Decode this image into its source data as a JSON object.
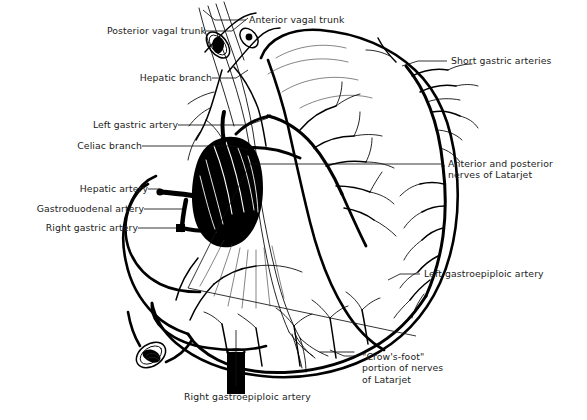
{
  "figure": {
    "type": "anatomical-line-illustration",
    "background_color": "#ffffff",
    "ink_color": "#000000",
    "label_color": "#222222"
  },
  "labels": [
    {
      "id": "posterior-vagal-trunk",
      "text": "Posterior vagal trunk",
      "align": "right",
      "x": 88,
      "y": 25
    },
    {
      "id": "anterior-vagal-trunk",
      "text": "Anterior vagal trunk",
      "align": "left",
      "x": 249,
      "y": 14
    },
    {
      "id": "hepatic-branch",
      "text": "Hepatic branch",
      "align": "right",
      "x": 122,
      "y": 72
    },
    {
      "id": "left-gastric-artery",
      "text": "Left gastric artery",
      "align": "right",
      "x": 80,
      "y": 119
    },
    {
      "id": "celiac-branch",
      "text": "Celiac branch",
      "align": "right",
      "x": 66,
      "y": 140
    },
    {
      "id": "hepatic-artery",
      "text": "Hepatic artery",
      "align": "right",
      "x": 68,
      "y": 183
    },
    {
      "id": "gastroduodenal-artery",
      "text": "Gastroduodenal artery",
      "align": "right",
      "x": 10,
      "y": 203
    },
    {
      "id": "right-gastric-artery",
      "text": "Right gastric artery",
      "align": "right",
      "x": 22,
      "y": 222
    },
    {
      "id": "short-gastric-arteries",
      "text": "Short gastric arteries",
      "align": "left",
      "x": 451,
      "y": 55
    },
    {
      "id": "nerves-of-latarjet",
      "text": "Anterior and posterior\nnerves of Latarjet",
      "align": "left",
      "x": 448,
      "y": 158
    },
    {
      "id": "left-gastroepiploic-artery",
      "text": "Left gastroepiploic artery",
      "align": "left",
      "x": 424,
      "y": 268
    },
    {
      "id": "crows-foot",
      "text": "\"Crow's-foot\"\nportion of nerves\nof Latarjet",
      "align": "left",
      "x": 362,
      "y": 351
    },
    {
      "id": "right-gastroepiploic-artery",
      "text": "Right gastroepiploic artery",
      "align": "left",
      "x": 184,
      "y": 391
    }
  ],
  "structures": [
    "esophagus-cut-end",
    "anterior-vagal-trunk-nerve",
    "posterior-vagal-trunk-nerve",
    "hepatic-branch-nerve",
    "celiac-branch-nerve",
    "stomach-body",
    "greater-curvature",
    "lesser-curvature",
    "fundus",
    "antrum",
    "pylorus",
    "duodenum-cut-end",
    "liver-silhouette",
    "celiac-trunk",
    "splenic-artery",
    "short-gastric-arteries-branches",
    "left-gastroepiploic-arcade",
    "right-gastroepiploic-arcade",
    "crows-foot-branches"
  ]
}
